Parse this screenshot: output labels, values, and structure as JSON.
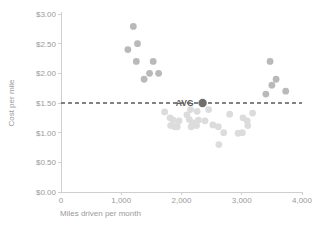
{
  "chart_data": {
    "type": "scatter",
    "title": "",
    "xlabel": "Miles driven per month",
    "ylabel": "Cost per mile",
    "xlim": [
      0,
      4000
    ],
    "ylim": [
      0.0,
      3.0
    ],
    "grid": false,
    "legend": null,
    "x_ticks": [
      0,
      1000,
      2000,
      3000,
      4000
    ],
    "x_tick_labels": [
      "0",
      "1,000",
      "2,000",
      "3,000",
      "4,000"
    ],
    "y_ticks": [
      0.0,
      0.5,
      1.0,
      1.5,
      2.0,
      2.5,
      3.0
    ],
    "y_tick_labels": [
      "$0.00",
      "$0.50",
      "$1.00",
      "$1.50",
      "$2.00",
      "$2.50",
      "$3.00"
    ],
    "annotations": [
      {
        "name": "average-reference-line",
        "type": "hline",
        "y": 1.5,
        "label": "AVG",
        "style": "dashed",
        "color": "#5a5a5a"
      }
    ],
    "series": [
      {
        "name": "High cost - low mileage",
        "color": "#b9b9b9",
        "marker": "circle",
        "points": [
          {
            "x": 1200,
            "y": 2.79
          },
          {
            "x": 1110,
            "y": 2.4
          },
          {
            "x": 1270,
            "y": 2.5
          },
          {
            "x": 1250,
            "y": 2.2
          },
          {
            "x": 1530,
            "y": 2.2
          },
          {
            "x": 1380,
            "y": 1.9
          },
          {
            "x": 1470,
            "y": 2.0
          },
          {
            "x": 1620,
            "y": 2.0
          }
        ]
      },
      {
        "name": "Low cost - mid mileage",
        "color": "#dcdcdc",
        "marker": "circle",
        "points": [
          {
            "x": 1720,
            "y": 1.35
          },
          {
            "x": 1810,
            "y": 1.25
          },
          {
            "x": 1860,
            "y": 1.21
          },
          {
            "x": 1820,
            "y": 1.12
          },
          {
            "x": 1890,
            "y": 1.1
          },
          {
            "x": 1960,
            "y": 1.2
          },
          {
            "x": 1930,
            "y": 1.1
          },
          {
            "x": 2090,
            "y": 1.3
          },
          {
            "x": 2150,
            "y": 1.39
          },
          {
            "x": 2130,
            "y": 1.22
          },
          {
            "x": 2180,
            "y": 1.17
          },
          {
            "x": 2160,
            "y": 1.1
          },
          {
            "x": 2260,
            "y": 1.36
          },
          {
            "x": 2280,
            "y": 1.21
          },
          {
            "x": 2250,
            "y": 1.12
          },
          {
            "x": 2390,
            "y": 1.2
          },
          {
            "x": 2450,
            "y": 1.39
          },
          {
            "x": 2520,
            "y": 1.13
          },
          {
            "x": 2610,
            "y": 1.1
          },
          {
            "x": 2620,
            "y": 0.8
          },
          {
            "x": 2700,
            "y": 1.0
          },
          {
            "x": 2800,
            "y": 1.31
          },
          {
            "x": 2940,
            "y": 0.99
          },
          {
            "x": 3010,
            "y": 1.0
          },
          {
            "x": 3020,
            "y": 1.25
          },
          {
            "x": 3090,
            "y": 1.2
          },
          {
            "x": 3100,
            "y": 1.12
          },
          {
            "x": 3180,
            "y": 1.33
          }
        ]
      },
      {
        "name": "High cost - high mileage",
        "color": "#b9b9b9",
        "marker": "circle",
        "points": [
          {
            "x": 3400,
            "y": 1.65
          },
          {
            "x": 3470,
            "y": 2.2
          },
          {
            "x": 3500,
            "y": 1.8
          },
          {
            "x": 3570,
            "y": 1.9
          },
          {
            "x": 3730,
            "y": 1.7
          }
        ]
      },
      {
        "name": "Average",
        "color": "#6f6f6f",
        "marker": "circle-large",
        "points": [
          {
            "x": 2350,
            "y": 1.5,
            "label": "AVG"
          }
        ]
      }
    ]
  },
  "axes": {
    "y_axis_title": "Cost per mile",
    "x_axis_title": "Miles driven per month"
  },
  "colors": {
    "marker_dark": "#b9b9b9",
    "marker_light": "#dcdcdc",
    "avg_marker": "#6f6f6f",
    "avg_line": "#5a5a5a",
    "axis": "#cfcfcf",
    "text": "#9a9a9a",
    "avg_text": "#5d5d5d",
    "background": "#ffffff"
  }
}
